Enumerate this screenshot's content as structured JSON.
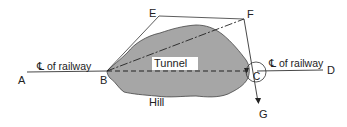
{
  "diagram": {
    "points": {
      "A": "A",
      "B": "B",
      "C": "C",
      "D": "D",
      "E": "E",
      "F": "F",
      "G": "G"
    },
    "labels": {
      "centerline_left": "℄ of railway",
      "centerline_right": "℄ of railway",
      "tunnel": "Tunnel",
      "hill": "Hill"
    },
    "colors": {
      "hill_fill": "#a6a6a6",
      "line": "#333333",
      "background": "#ffffff"
    }
  }
}
